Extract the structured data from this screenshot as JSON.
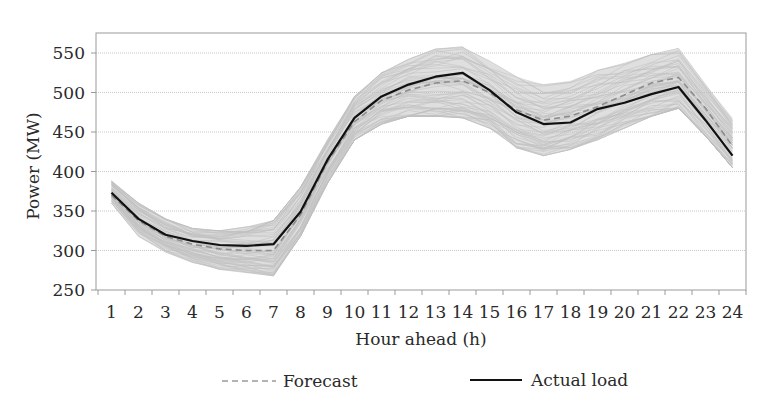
{
  "chart_data": {
    "type": "line",
    "title": "",
    "xlabel": "Hour ahead (h)",
    "ylabel": "Power (MW)",
    "ylim": [
      250,
      570
    ],
    "yticks": [
      250,
      300,
      350,
      400,
      450,
      500,
      550
    ],
    "x": [
      1,
      2,
      3,
      4,
      5,
      6,
      7,
      8,
      9,
      10,
      11,
      12,
      13,
      14,
      15,
      16,
      17,
      18,
      19,
      20,
      21,
      22,
      23,
      24
    ],
    "grid": true,
    "legend_position": "bottom",
    "series": [
      {
        "name": "Actual load",
        "style": "solid",
        "color": "#111111",
        "values": [
          373,
          340,
          320,
          312,
          307,
          306,
          308,
          349,
          415,
          468,
          495,
          510,
          520,
          525,
          503,
          475,
          460,
          462,
          479,
          487,
          498,
          507,
          465,
          420
        ]
      },
      {
        "name": "Forecast",
        "style": "dashed",
        "color": "#8c8c8c",
        "values": [
          370,
          338,
          318,
          308,
          302,
          300,
          300,
          345,
          412,
          463,
          490,
          503,
          512,
          515,
          500,
          478,
          465,
          470,
          482,
          497,
          512,
          519,
          480,
          432
        ]
      }
    ],
    "ensemble_band": {
      "name": "Forecast scenarios",
      "color": "#b9b9b9",
      "count": 60,
      "upper": [
        388,
        360,
        340,
        328,
        325,
        330,
        338,
        380,
        440,
        495,
        525,
        542,
        555,
        558,
        540,
        520,
        510,
        515,
        528,
        537,
        548,
        556,
        510,
        468
      ],
      "lower": [
        360,
        318,
        298,
        285,
        276,
        272,
        268,
        318,
        385,
        440,
        460,
        470,
        470,
        468,
        455,
        430,
        420,
        428,
        440,
        455,
        470,
        480,
        445,
        405
      ]
    },
    "legend": [
      {
        "label": "Forecast",
        "style": "dashed"
      },
      {
        "label": "Actual load",
        "style": "solid"
      }
    ]
  }
}
